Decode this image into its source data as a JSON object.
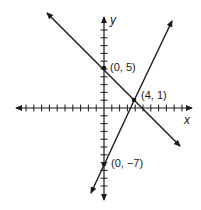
{
  "chart_data": {
    "type": "line",
    "title": "",
    "xlabel": "x",
    "ylabel": "y",
    "xlim": [
      -11,
      11
    ],
    "ylim": [
      -11,
      11
    ],
    "grid": false,
    "tick_interval": 1,
    "series": [
      {
        "name": "line through (0, 5) and (4, 1)",
        "equation": "y = -x + 5",
        "points": [
          [
            0,
            5
          ],
          [
            4,
            1
          ]
        ]
      },
      {
        "name": "line through (0, -7) and (4, 1)",
        "equation": "y = 2x - 7",
        "points": [
          [
            0,
            -7
          ],
          [
            4,
            1
          ]
        ]
      }
    ],
    "annotations": [
      {
        "text": "(0, 5)",
        "x": 0,
        "y": 5
      },
      {
        "text": "(4, 1)",
        "x": 4,
        "y": 1
      },
      {
        "text": "(0, −7)",
        "x": 0,
        "y": -7
      }
    ]
  },
  "labels": {
    "x_axis": "x",
    "y_axis": "y",
    "point_a": "(0, 5)",
    "point_b": "(4, 1)",
    "point_c": "(0, −7)"
  },
  "colors": {
    "ink": "#1a1a1a",
    "background": "#ffffff"
  }
}
